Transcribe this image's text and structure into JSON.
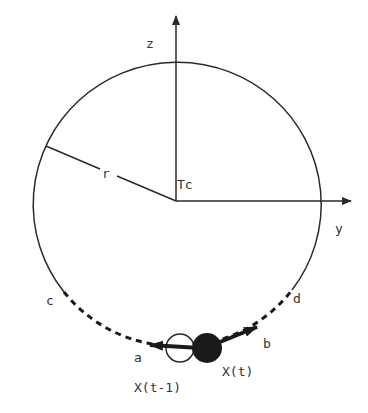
{
  "diagram": {
    "type": "orbit-diagram",
    "colors": {
      "stroke": "#2a2a2a",
      "label": "#333333",
      "fill_current": "#1a1a1a",
      "fill_previous": "#ffffff"
    },
    "axes": {
      "z_label": "z",
      "y_label": "y"
    },
    "center_label": "Tc",
    "radius_label": "r",
    "arc_points": {
      "c": "c",
      "d": "d",
      "a": "a",
      "b": "b"
    },
    "positions": {
      "previous": "X(t-1)",
      "current": "X(t)"
    }
  }
}
